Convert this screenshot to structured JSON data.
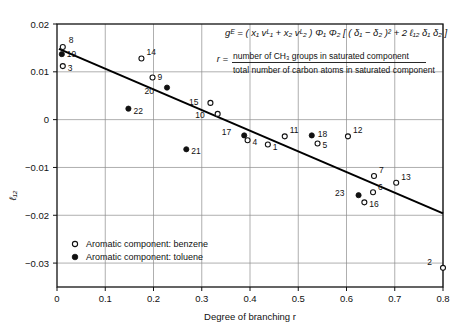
{
  "chart_data": {
    "type": "scatter",
    "title": "",
    "xlabel": "Degree of branching r",
    "ylabel": "ℓ₁₂",
    "xlim": [
      0,
      0.8
    ],
    "ylim": [
      -0.035,
      0.02
    ],
    "grid": true,
    "xticks": [
      0,
      0.1,
      0.2,
      0.3,
      0.4,
      0.5,
      0.6,
      0.7,
      0.8
    ],
    "xtick_labels": [
      "0",
      "0.1",
      "0.2",
      "0.3",
      "0.4",
      "0.5",
      "0.6",
      "0.7",
      "0.8"
    ],
    "yticks": [
      0.02,
      0.01,
      0,
      -0.01,
      -0.02,
      -0.03
    ],
    "ytick_labels": [
      "0.02",
      "0.01",
      "0",
      "−0.01",
      "−0.02",
      "−0.03"
    ],
    "legend_position": "bottom-left",
    "series": [
      {
        "name": "Aromatic component: benzene",
        "marker": "open-circle",
        "points": [
          {
            "id": "8",
            "x": 0.012,
            "y": 0.0152,
            "label_dx": 6,
            "label_dy": -4
          },
          {
            "id": "3",
            "x": 0.012,
            "y": 0.0112,
            "label_dx": 5,
            "label_dy": 5
          },
          {
            "id": "14",
            "x": 0.175,
            "y": 0.0128,
            "label_dx": 5,
            "label_dy": -3
          },
          {
            "id": "9",
            "x": 0.198,
            "y": 0.0088,
            "label_dx": 5,
            "label_dy": 2
          },
          {
            "id": "15",
            "x": 0.318,
            "y": 0.0035,
            "label_dx": -12,
            "label_dy": 2
          },
          {
            "id": "10",
            "x": 0.333,
            "y": 0.0012,
            "label_dx": -13,
            "label_dy": 4
          },
          {
            "id": "4",
            "x": 0.395,
            "y": -0.0043,
            "label_dx": 5,
            "label_dy": 5
          },
          {
            "id": "1",
            "x": 0.437,
            "y": -0.0052,
            "label_dx": 5,
            "label_dy": 5
          },
          {
            "id": "11",
            "x": 0.472,
            "y": -0.0035,
            "label_dx": 5,
            "label_dy": -3
          },
          {
            "id": "5",
            "x": 0.54,
            "y": -0.005,
            "label_dx": 5,
            "label_dy": 4
          },
          {
            "id": "12",
            "x": 0.603,
            "y": -0.0035,
            "label_dx": 5,
            "label_dy": -3
          },
          {
            "id": "7",
            "x": 0.657,
            "y": -0.0118,
            "label_dx": 5,
            "label_dy": -3
          },
          {
            "id": "13",
            "x": 0.703,
            "y": -0.0132,
            "label_dx": 5,
            "label_dy": -3
          },
          {
            "id": "6",
            "x": 0.655,
            "y": -0.0152,
            "label_dx": 5,
            "label_dy": -2
          },
          {
            "id": "16",
            "x": 0.637,
            "y": -0.0173,
            "label_dx": 5,
            "label_dy": 5
          },
          {
            "id": "2",
            "x": 0.8,
            "y": -0.031,
            "label_dx": -11,
            "label_dy": -3
          }
        ]
      },
      {
        "name": "Aromatic component: toluene",
        "marker": "filled-circle",
        "points": [
          {
            "id": "19",
            "x": 0.01,
            "y": 0.0137,
            "label_dx": 5,
            "label_dy": 3
          },
          {
            "id": "20",
            "x": 0.228,
            "y": 0.0067,
            "label_dx": -13,
            "label_dy": 6
          },
          {
            "id": "22",
            "x": 0.148,
            "y": 0.0023,
            "label_dx": 5,
            "label_dy": 5
          },
          {
            "id": "17",
            "x": 0.388,
            "y": -0.0033,
            "label_dx": -13,
            "label_dy": 0
          },
          {
            "id": "21",
            "x": 0.268,
            "y": -0.0062,
            "label_dx": 5,
            "label_dy": 5
          },
          {
            "id": "18",
            "x": 0.528,
            "y": -0.0033,
            "label_dx": 6,
            "label_dy": 2
          },
          {
            "id": "23",
            "x": 0.625,
            "y": -0.0158,
            "label_dx": -14,
            "label_dy": 1
          }
        ]
      }
    ],
    "trendline": {
      "x0": 0.004,
      "y0": 0.0148,
      "x1": 0.8,
      "y1": -0.0196
    }
  },
  "annotations": {
    "equation": "gᴱ = ( x₁ vᴸ₁ + x₂ vᴸ₂ ) Φ₁ Φ₂ [ ( δ₁ − δ₂ )² + 2 ℓ₁₂ δ₁ δ₂ ]",
    "ratio_symbol": "r =",
    "ratio_numerator": "number of CH₃ groups in saturated component",
    "ratio_denominator": "total number of carbon atoms in saturated component"
  },
  "legend": {
    "items": [
      {
        "marker": "open-circle",
        "label": "Aromatic component: benzene"
      },
      {
        "marker": "filled-circle",
        "label": "Aromatic component: toluene"
      }
    ]
  },
  "colors": {
    "axis": "#111111",
    "grid": "#8d8d8d",
    "marker": "#111111",
    "trendline": "#000000",
    "background": "#ffffff"
  }
}
